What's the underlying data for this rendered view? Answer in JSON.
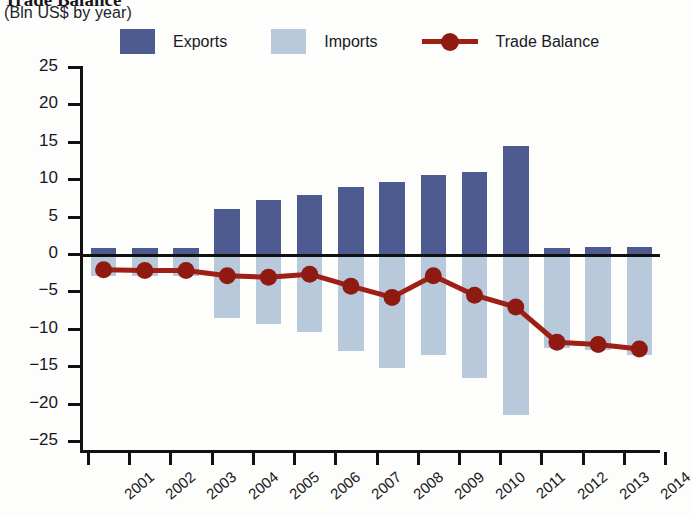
{
  "header": {
    "title": "Trade Balance",
    "subtitle": "(Bln US$ by year)"
  },
  "legend": {
    "position": "top",
    "items": [
      {
        "label": "Exports",
        "color": "#4e5b90",
        "marker": "square"
      },
      {
        "label": "Imports",
        "color": "#b8c9dc",
        "marker": "square"
      },
      {
        "label": "Trade Balance",
        "color": "#9e1f16",
        "marker": "line-circle"
      }
    ]
  },
  "chart_data": {
    "type": "bar",
    "title": "Trade Balance",
    "subtitle": "(Bln US$ by year)",
    "xlabel": "",
    "ylabel": "",
    "ylim": [
      -25,
      25
    ],
    "yticks": [
      25,
      20,
      15,
      10,
      5,
      0,
      -5,
      -10,
      -15,
      -20,
      -25
    ],
    "ytick_labels": [
      "25",
      "20",
      "15",
      "10",
      "5",
      "0",
      "−5",
      "−10",
      "−15",
      "−20",
      "−25"
    ],
    "grid": false,
    "categories": [
      "2001",
      "2002",
      "2003",
      "2004",
      "2005",
      "2006",
      "2007",
      "2008",
      "2009",
      "2010",
      "2011",
      "2012",
      "2013",
      "2014"
    ],
    "series": [
      {
        "name": "Exports",
        "type": "bar",
        "color": "#4e5b90",
        "values": [
          0.8,
          0.8,
          0.8,
          6.0,
          7.2,
          7.9,
          8.9,
          9.6,
          10.6,
          11.0,
          14.5,
          0.8,
          0.9,
          0.9
        ]
      },
      {
        "name": "Imports",
        "type": "bar",
        "color": "#b8c9dc",
        "values": [
          -2.9,
          -3.0,
          -3.0,
          -8.6,
          -9.3,
          -10.4,
          -13.0,
          -15.2,
          -13.5,
          -16.6,
          -21.5,
          -12.5,
          -12.8,
          -13.5
        ]
      },
      {
        "name": "Trade Balance",
        "type": "line",
        "color": "#9e1f16",
        "values": [
          -2.1,
          -2.2,
          -2.2,
          -2.9,
          -3.1,
          -2.7,
          -4.3,
          -5.8,
          -2.9,
          -5.5,
          -7.1,
          -11.8,
          -12.1,
          -12.7
        ]
      }
    ]
  }
}
